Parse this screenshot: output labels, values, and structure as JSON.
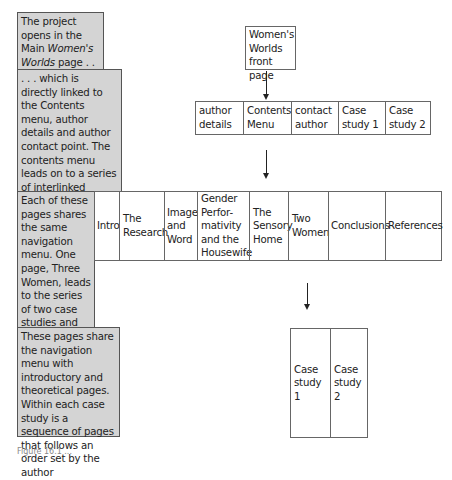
{
  "notes": [
    {
      "text_before": "The project opens in the Main ",
      "text_italic": "Women's Worlds",
      "text_after": " page . . ."
    },
    {
      "text": ". . . which is directly linked to the Contents menu, author details and author contact point. The contents menu leads on to a series of interlinked introductory and theoretical pages"
    },
    {
      "text": "Each of these pages shares the same navigation menu. One page, Three Women, leads to the series of two case studies and analytical comments"
    },
    {
      "text": "These pages share the navigation menu with introductory and theoretical pages. Within each case study is a sequence of pages that follows an order set by the author"
    }
  ],
  "front_page": {
    "label": "Women's Worlds front page"
  },
  "contents_row": [
    {
      "label": "author details"
    },
    {
      "label": "Contents Menu"
    },
    {
      "label": "contact author"
    },
    {
      "label": "Case study 1"
    },
    {
      "label": "Case study 2"
    }
  ],
  "nav_row": [
    {
      "label": "Intro"
    },
    {
      "label": "The Research"
    },
    {
      "label": "Image and Word"
    },
    {
      "label": "Gender Perfor-mativity and the Housewife"
    },
    {
      "label": "The Sensory Home"
    },
    {
      "label": "Two Women"
    },
    {
      "label": "Conclusions"
    },
    {
      "label": "References"
    }
  ],
  "case_studies": [
    {
      "label": "Case study 1"
    },
    {
      "label": "Case study 2"
    }
  ],
  "caption": "Figure 16.1 ..."
}
